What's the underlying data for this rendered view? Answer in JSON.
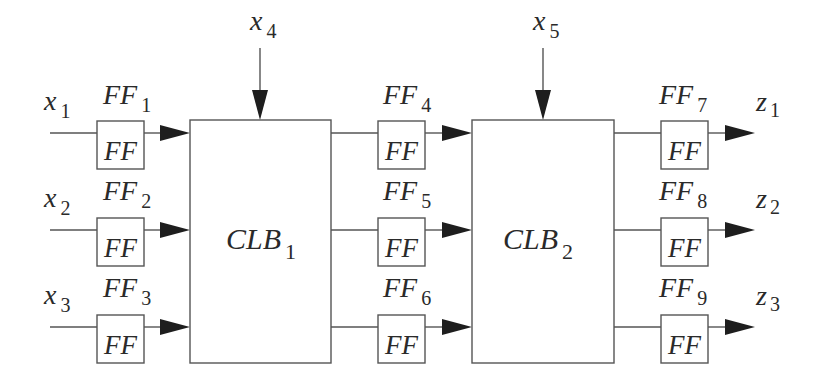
{
  "diagram": {
    "type": "block-diagram",
    "inputs": [
      {
        "name": "x",
        "sub": "1"
      },
      {
        "name": "x",
        "sub": "2"
      },
      {
        "name": "x",
        "sub": "3"
      }
    ],
    "side_inputs": [
      {
        "name": "x",
        "sub": "4",
        "target": "CLB1"
      },
      {
        "name": "x",
        "sub": "5",
        "target": "CLB2"
      }
    ],
    "outputs": [
      {
        "name": "z",
        "sub": "1"
      },
      {
        "name": "z",
        "sub": "2"
      },
      {
        "name": "z",
        "sub": "3"
      }
    ],
    "clbs": [
      {
        "name": "CLB",
        "sub": "1"
      },
      {
        "name": "CLB",
        "sub": "2"
      }
    ],
    "flipflop_box_label": "FF",
    "flipflops": [
      {
        "name": "FF",
        "sub": "1"
      },
      {
        "name": "FF",
        "sub": "2"
      },
      {
        "name": "FF",
        "sub": "3"
      },
      {
        "name": "FF",
        "sub": "4"
      },
      {
        "name": "FF",
        "sub": "5"
      },
      {
        "name": "FF",
        "sub": "6"
      },
      {
        "name": "FF",
        "sub": "7"
      },
      {
        "name": "FF",
        "sub": "8"
      },
      {
        "name": "FF",
        "sub": "9"
      }
    ],
    "connections": [
      "x1 -> FF1 -> CLB1",
      "x2 -> FF2 -> CLB1",
      "x3 -> FF3 -> CLB1",
      "x4 -> CLB1",
      "CLB1 -> FF4 -> CLB2",
      "CLB1 -> FF5 -> CLB2",
      "CLB1 -> FF6 -> CLB2",
      "x5 -> CLB2",
      "CLB2 -> FF7 -> z1",
      "CLB2 -> FF8 -> z2",
      "CLB2 -> FF9 -> z3"
    ]
  }
}
